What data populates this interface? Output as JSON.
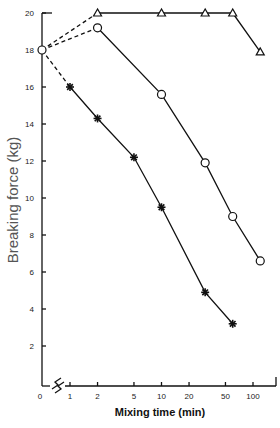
{
  "chart_data": {
    "type": "line",
    "title": "",
    "xlabel": "Mixing time (min)",
    "ylabel": "Breaking force (kg)",
    "x_scale": "log",
    "x_ticks": [
      "0",
      "1",
      "2",
      "5",
      "10",
      "20",
      "50",
      "100"
    ],
    "y_ticks": [
      "2",
      "4",
      "6",
      "8",
      "10",
      "12",
      "14",
      "16",
      "18",
      "20"
    ],
    "ylim": [
      0,
      20
    ],
    "grid": false,
    "legend": "none",
    "initial_point": {
      "x": 0,
      "y": 18,
      "note": "dashed connectors from t=0 to first point of each series"
    },
    "series": [
      {
        "name": "triangles",
        "marker": "triangle",
        "x": [
          0,
          2,
          10,
          30,
          60,
          120
        ],
        "y": [
          18,
          20,
          20,
          20,
          20,
          17.9
        ]
      },
      {
        "name": "circles",
        "marker": "circle",
        "x": [
          0,
          2,
          10,
          30,
          60,
          120
        ],
        "y": [
          18,
          19.2,
          15.6,
          11.9,
          9.0,
          6.6
        ]
      },
      {
        "name": "asterisks",
        "marker": "asterisk",
        "x": [
          0,
          1,
          2,
          5,
          10,
          30,
          60
        ],
        "y": [
          18,
          16.0,
          14.3,
          12.2,
          9.5,
          4.9,
          3.2
        ]
      }
    ]
  }
}
